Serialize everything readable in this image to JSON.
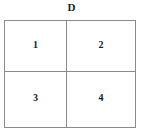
{
  "figure": {
    "top_label": "D",
    "background_color": "#ffffff",
    "border_color": "#8a8a8a",
    "text_color": "#1a1a1a",
    "grid": {
      "rows": 2,
      "columns": 2,
      "cells": [
        {
          "label": "1",
          "row": 0,
          "column": 0
        },
        {
          "label": "2",
          "row": 0,
          "column": 1
        },
        {
          "label": "3",
          "row": 1,
          "column": 0
        },
        {
          "label": "4",
          "row": 1,
          "column": 1
        }
      ]
    }
  }
}
